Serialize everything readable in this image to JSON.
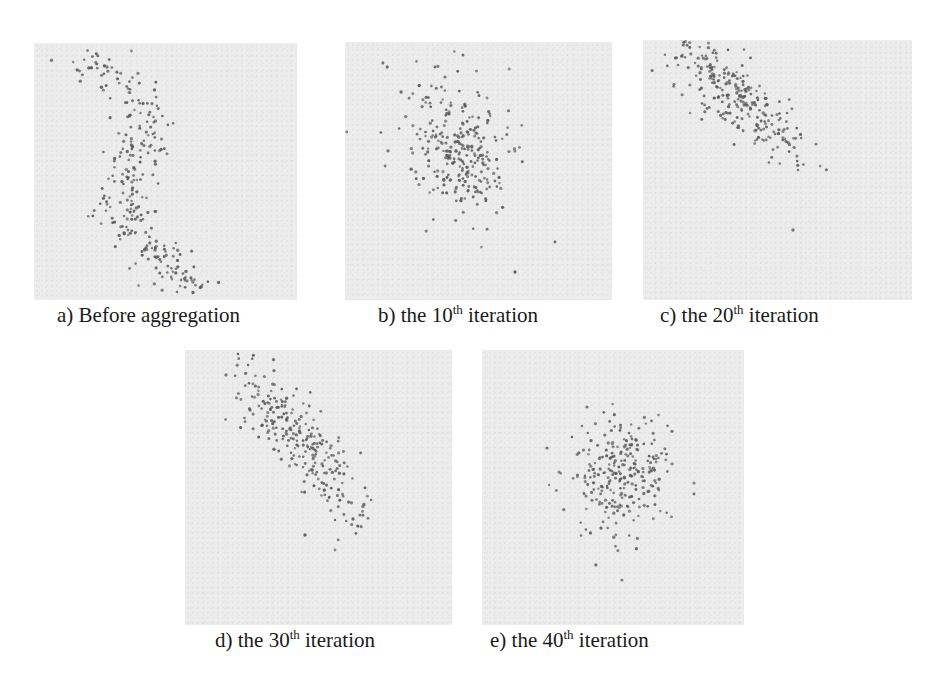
{
  "figure": {
    "panels": [
      {
        "id": "a",
        "caption_prefix": "a) Before aggregation",
        "caption_number": "",
        "caption_sup": "",
        "caption_suffix": ""
      },
      {
        "id": "b",
        "caption_prefix": "b) the ",
        "caption_number": "10",
        "caption_sup": "th",
        "caption_suffix": " iteration"
      },
      {
        "id": "c",
        "caption_prefix": "c) the ",
        "caption_number": "20",
        "caption_sup": "th",
        "caption_suffix": " iteration"
      },
      {
        "id": "d",
        "caption_prefix": "d) the ",
        "caption_number": "30",
        "caption_sup": "th",
        "caption_suffix": " iteration"
      },
      {
        "id": "e",
        "caption_prefix": "e) the ",
        "caption_number": "40",
        "caption_sup": "th",
        "caption_suffix": " iteration"
      }
    ],
    "colors": {
      "panel_bg": "#ececec",
      "dot": "#5a5a5a",
      "text": "#1a1a1a"
    }
  },
  "chart_data": [
    {
      "type": "scatter",
      "title": "a) Before aggregation",
      "description": "Sparse, elongated S-shaped swarm running from upper-left to bottom-center",
      "grid": false,
      "cluster": {
        "shape": "S-curve",
        "spread": "wide",
        "approx_points": 300
      }
    },
    {
      "type": "scatter",
      "title": "b) the 10th iteration",
      "description": "Points concentrated around the center with scattered outliers",
      "grid": false,
      "cluster": {
        "center_rel": [
          0.42,
          0.42
        ],
        "spread": "medium",
        "approx_points": 300
      }
    },
    {
      "type": "scatter",
      "title": "c) the 20th iteration",
      "description": "Diagonal band from upper-left to center",
      "grid": false,
      "cluster": {
        "center_rel": [
          0.35,
          0.22
        ],
        "spread": "diagonal band",
        "approx_points": 300
      }
    },
    {
      "type": "scatter",
      "title": "d) the 30th iteration",
      "description": "Tighter diagonal band in upper-left quadrant",
      "grid": false,
      "cluster": {
        "center_rel": [
          0.4,
          0.3
        ],
        "spread": "tight diagonal",
        "approx_points": 300
      }
    },
    {
      "type": "scatter",
      "title": "e) the 40th iteration",
      "description": "Compact roughly circular cluster near center",
      "grid": false,
      "cluster": {
        "center_rel": [
          0.52,
          0.35
        ],
        "spread": "compact round",
        "approx_points": 300
      }
    }
  ]
}
